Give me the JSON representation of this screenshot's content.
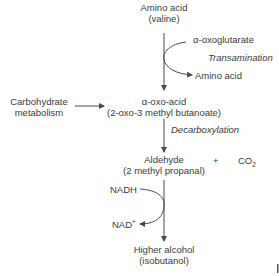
{
  "diagram": {
    "nodes": {
      "amino_acid_start": {
        "line1": "Amino acid",
        "line2": "(valine)"
      },
      "oxoglutarate": "α-oxoglutarate",
      "transamination": "Transamination",
      "amino_acid_product": "Amino acid",
      "carbohydrate": {
        "line1": "Carbohydrate",
        "line2": "metabolism"
      },
      "oxo_acid": {
        "line1": "α-oxo-acid",
        "line2": "(2-oxo-3 methyl butanoate)"
      },
      "decarboxylation": "Decarboxylation",
      "aldehyde": {
        "line1": "Aldehyde",
        "line2": "(2 methyl propanal)"
      },
      "plus": "+",
      "co2": {
        "base": "CO",
        "sub": "2"
      },
      "nadh": "NADH",
      "nad": {
        "base": "NAD",
        "sup": "+"
      },
      "higher_alcohol": {
        "line1": "Higher alcohol",
        "line2": "(isobutanol)"
      }
    },
    "colors": {
      "line": "#4a4a4a",
      "text": "#3a3a3a"
    }
  }
}
